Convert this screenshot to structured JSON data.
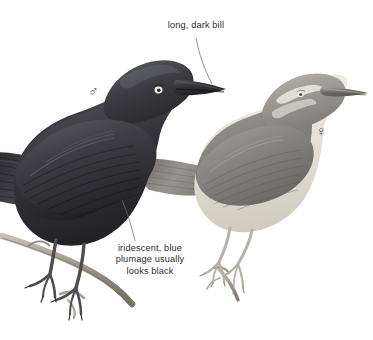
{
  "plate": {
    "background_color": "#ffffff",
    "width": 373,
    "height": 340,
    "medium": "bird field-guide illustration"
  },
  "annotations": {
    "bill": {
      "text": "long, dark bill",
      "color": "#2b2b2f",
      "leader_line": "from text down-right to the male bird's bill"
    },
    "plumage": {
      "line1": "iridescent, blue",
      "line2": "plumage usually",
      "line3": "looks black",
      "color": "#2b2b2f",
      "leader_line": "from text up-left to the male bird's flank"
    }
  },
  "symbols": {
    "male": "♂",
    "female": "♀",
    "color": "#55565c"
  },
  "birds": [
    {
      "id": "male",
      "sex": "male",
      "position": "left, foreground",
      "facing": "right",
      "body_color": "#3a3a3e",
      "highlight_color": "#6d6e74",
      "eye_color": "#f2efdf",
      "bill_color": "#2e2e32",
      "leg_color": "#4a4a4e",
      "perch": "diagonal branch, lower left"
    },
    {
      "id": "female",
      "sex": "female",
      "position": "right, background",
      "facing": "right",
      "body_color": "#8e8d8c",
      "underside_color": "#e4e0d7",
      "eye_color": "#eceadd",
      "bill_color": "#6f6e6d",
      "leg_color": "#b9b4aa",
      "perch": "small twig, lower right"
    }
  ],
  "branch": {
    "color": "#aaa49a",
    "shadow_color": "#7c766c"
  }
}
